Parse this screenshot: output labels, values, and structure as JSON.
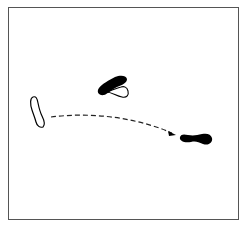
{
  "diagram": {
    "colors": {
      "frame": "#555555",
      "fill": "#000000",
      "background": "#ffffff"
    },
    "shapes": [
      {
        "id": "left-outline-shape",
        "style": "outline"
      },
      {
        "id": "top-filled-shape",
        "style": "filled"
      },
      {
        "id": "top-outline-shape",
        "style": "outline"
      },
      {
        "id": "right-filled-shape",
        "style": "filled"
      }
    ],
    "arrow": {
      "style": "dashed",
      "from": "left-outline-shape",
      "to": "right-filled-shape"
    }
  }
}
